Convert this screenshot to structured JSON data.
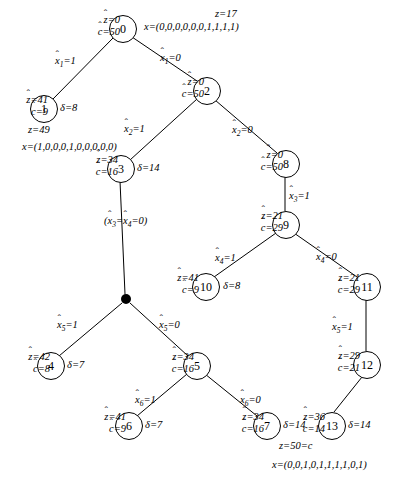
{
  "diagram": {
    "symbols": {
      "z_hat": "z",
      "c_hat": "c",
      "delta": "δ",
      "z": "z",
      "x": "x"
    },
    "nodes": [
      {
        "id": "n0",
        "label": "0",
        "cx": 122,
        "cy": 28,
        "r": 13
      },
      {
        "id": "n1",
        "label": "1",
        "cx": 43,
        "cy": 108,
        "r": 13
      },
      {
        "id": "n2",
        "label": "2",
        "cx": 206,
        "cy": 90,
        "r": 13
      },
      {
        "id": "n3",
        "label": "3",
        "cx": 120,
        "cy": 168,
        "r": 13
      },
      {
        "id": "n4",
        "label": "4",
        "cx": 50,
        "cy": 365,
        "r": 13
      },
      {
        "id": "n5",
        "label": "5",
        "cx": 196,
        "cy": 365,
        "r": 13
      },
      {
        "id": "n6",
        "label": "6",
        "cx": 128,
        "cy": 425,
        "r": 13
      },
      {
        "id": "n7",
        "label": "7",
        "cx": 266,
        "cy": 425,
        "r": 13
      },
      {
        "id": "n8",
        "label": "8",
        "cx": 285,
        "cy": 163,
        "r": 13
      },
      {
        "id": "n9",
        "label": "9",
        "cx": 285,
        "cy": 224,
        "r": 13
      },
      {
        "id": "n10",
        "label": "10",
        "cx": 205,
        "cy": 286,
        "r": 13
      },
      {
        "id": "n11",
        "label": "11",
        "cx": 366,
        "cy": 286,
        "r": 13
      },
      {
        "id": "n12",
        "label": "12",
        "cx": 366,
        "cy": 364,
        "r": 13
      },
      {
        "id": "n13",
        "label": "13",
        "cx": 331,
        "cy": 425,
        "r": 13
      }
    ],
    "branch_point": {
      "id": "bp",
      "cx": 126,
      "cy": 299,
      "r": 5
    },
    "edges": [
      {
        "from": "n0",
        "to": "n1",
        "x1": 113,
        "y1": 38,
        "x2": 53,
        "y2": 99
      },
      {
        "from": "n0",
        "to": "n2",
        "x1": 132,
        "y1": 37,
        "x2": 197,
        "y2": 81
      },
      {
        "from": "n2",
        "to": "n3",
        "x1": 197,
        "y1": 99,
        "x2": 130,
        "y2": 160
      },
      {
        "from": "n2",
        "to": "n8",
        "x1": 215,
        "y1": 100,
        "x2": 277,
        "y2": 153
      },
      {
        "from": "n3",
        "to": "bp",
        "x1": 120,
        "y1": 181,
        "x2": 125,
        "y2": 294
      },
      {
        "from": "bp",
        "to": "n4",
        "x1": 122,
        "y1": 303,
        "x2": 59,
        "y2": 356
      },
      {
        "from": "bp",
        "to": "n5",
        "x1": 130,
        "y1": 303,
        "x2": 188,
        "y2": 356
      },
      {
        "from": "n5",
        "to": "n6",
        "x1": 187,
        "y1": 374,
        "x2": 137,
        "y2": 416
      },
      {
        "from": "n5",
        "to": "n7",
        "x1": 205,
        "y1": 374,
        "x2": 257,
        "y2": 416
      },
      {
        "from": "n8",
        "to": "n9",
        "x1": 285,
        "y1": 176,
        "x2": 285,
        "y2": 211
      },
      {
        "from": "n9",
        "to": "n10",
        "x1": 276,
        "y1": 233,
        "x2": 214,
        "y2": 277
      },
      {
        "from": "n9",
        "to": "n11",
        "x1": 294,
        "y1": 233,
        "x2": 357,
        "y2": 277
      },
      {
        "from": "n11",
        "to": "n12",
        "x1": 366,
        "y1": 299,
        "x2": 366,
        "y2": 351
      },
      {
        "from": "n12",
        "to": "n13",
        "x1": 362,
        "y1": 377,
        "x2": 334,
        "y2": 412
      }
    ],
    "edge_labels": [
      {
        "id": "e-0-1",
        "text_var": "x",
        "sub": "1",
        "value": "1",
        "x": 55,
        "y": 55
      },
      {
        "id": "e-0-2",
        "text_var": "x",
        "sub": "1",
        "value": "0",
        "x": 160,
        "y": 52
      },
      {
        "id": "e-2-3",
        "text_var": "x",
        "sub": "2",
        "value": "1",
        "x": 124,
        "y": 123
      },
      {
        "id": "e-2-8",
        "text_var": "x",
        "sub": "2",
        "value": "0",
        "x": 232,
        "y": 124
      },
      {
        "id": "e-bp-4",
        "text_var": "x",
        "sub": "5",
        "value": "1",
        "x": 57,
        "y": 319
      },
      {
        "id": "e-bp-5",
        "text_var": "x",
        "sub": "5",
        "value": "0",
        "x": 159,
        "y": 319
      },
      {
        "id": "e-5-6",
        "text_var": "x",
        "sub": "6",
        "value": "1",
        "x": 135,
        "y": 394
      },
      {
        "id": "e-5-7",
        "text_var": "x",
        "sub": "6",
        "value": "0",
        "x": 240,
        "y": 394
      },
      {
        "id": "e-8-9",
        "text_var": "x",
        "sub": "3",
        "value": "1",
        "x": 289,
        "y": 190
      },
      {
        "id": "e-9-10",
        "text_var": "x",
        "sub": "4",
        "value": "1",
        "x": 215,
        "y": 252
      },
      {
        "id": "e-9-11",
        "text_var": "x",
        "sub": "4",
        "value": "0",
        "x": 316,
        "y": 251
      },
      {
        "id": "e-11-12",
        "text_var": "x",
        "sub": "5",
        "value": "1",
        "x": 332,
        "y": 321
      }
    ],
    "branch_condition": {
      "id": "cond-3-bp",
      "text": "(ẍ3=ẍ4=0)",
      "x": 104,
      "y": 215
    },
    "node_annotations": [
      {
        "id": "a0",
        "node": "n0",
        "zhat": "0",
        "chat": "50",
        "x": 74,
        "y": 14,
        "align": "right"
      },
      {
        "id": "a1",
        "node": "n1",
        "zhat": "41",
        "chat": "9",
        "x": 2,
        "y": 94,
        "align": "right"
      },
      {
        "id": "a2",
        "node": "n2",
        "zhat": "0",
        "chat": "50",
        "x": 158,
        "y": 76,
        "align": "right"
      },
      {
        "id": "a3",
        "node": "n3",
        "zhat": "34",
        "chat": "16",
        "x": 72,
        "y": 154,
        "align": "right"
      },
      {
        "id": "a4",
        "node": "n4",
        "zhat": "42",
        "chat": "8",
        "x": 4,
        "y": 351,
        "align": "right"
      },
      {
        "id": "a5",
        "node": "n5",
        "zhat": "34",
        "chat": "16",
        "x": 148,
        "y": 351,
        "align": "right"
      },
      {
        "id": "a6",
        "node": "n6",
        "zhat": "41",
        "chat": "9",
        "x": 80,
        "y": 411,
        "align": "right"
      },
      {
        "id": "a7",
        "node": "n7",
        "zhat": "34",
        "chat": "16",
        "x": 218,
        "y": 411,
        "align": "right"
      },
      {
        "id": "a8",
        "node": "n8",
        "zhat": "0",
        "chat": "50",
        "x": 237,
        "y": 149,
        "align": "right"
      },
      {
        "id": "a9",
        "node": "n9",
        "zhat": "21",
        "chat": "29",
        "x": 237,
        "y": 210,
        "align": "right"
      },
      {
        "id": "a10",
        "node": "n10",
        "zhat": "41",
        "chat": "9",
        "x": 153,
        "y": 272,
        "align": "right"
      },
      {
        "id": "a11",
        "node": "n11",
        "zhat": "21",
        "chat": "29",
        "x": 314,
        "y": 272,
        "align": "right"
      },
      {
        "id": "a12",
        "node": "n12",
        "zhat": "29",
        "chat": "21",
        "x": 314,
        "y": 350,
        "align": "right"
      },
      {
        "id": "a13",
        "node": "n13",
        "zhat": "36",
        "chat": "14",
        "x": 279,
        "y": 411,
        "align": "right"
      }
    ],
    "delta_labels": [
      {
        "id": "d1",
        "node": "n1",
        "value": "8",
        "x": 60,
        "y": 102
      },
      {
        "id": "d3",
        "node": "n3",
        "value": "14",
        "x": 137,
        "y": 162
      },
      {
        "id": "d4",
        "node": "n4",
        "value": "7",
        "x": 67,
        "y": 359
      },
      {
        "id": "d6",
        "node": "n6",
        "value": "7",
        "x": 145,
        "y": 419
      },
      {
        "id": "d7",
        "node": "n7",
        "value": "14",
        "x": 283,
        "y": 419
      },
      {
        "id": "d10",
        "node": "n10",
        "value": "8",
        "x": 223,
        "y": 280
      },
      {
        "id": "d13",
        "node": "n13",
        "value": "14",
        "x": 348,
        "y": 419
      }
    ],
    "solutions": [
      {
        "id": "sol-node0",
        "node": "n0",
        "z_label": "z=17",
        "z_x": 215,
        "z_y": 8,
        "x_label": "x=(0,0,0,0,0,0,1,1,1,1)",
        "x_x": 144,
        "x_y": 21,
        "vector": [
          0,
          0,
          0,
          0,
          0,
          0,
          1,
          1,
          1,
          1
        ],
        "objective": 17
      },
      {
        "id": "sol-node1",
        "node": "n1",
        "z_label": "z=49",
        "z_x": 28,
        "z_y": 124,
        "x_label": "x=(1,0,0,0,1,0,0,0,0,0)",
        "x_x": 22,
        "x_y": 141,
        "vector": [
          1,
          0,
          0,
          0,
          1,
          0,
          0,
          0,
          0,
          0
        ],
        "objective": 49
      },
      {
        "id": "sol-node13",
        "node": "n13",
        "z_label": "z=50=c",
        "z_x": 279,
        "z_y": 440,
        "x_label": "x=(0,0,1,0,1,1,1,1,0,1)",
        "x_x": 272,
        "x_y": 459,
        "vector": [
          0,
          0,
          1,
          0,
          1,
          1,
          1,
          1,
          0,
          1
        ],
        "objective": 50
      }
    ]
  }
}
